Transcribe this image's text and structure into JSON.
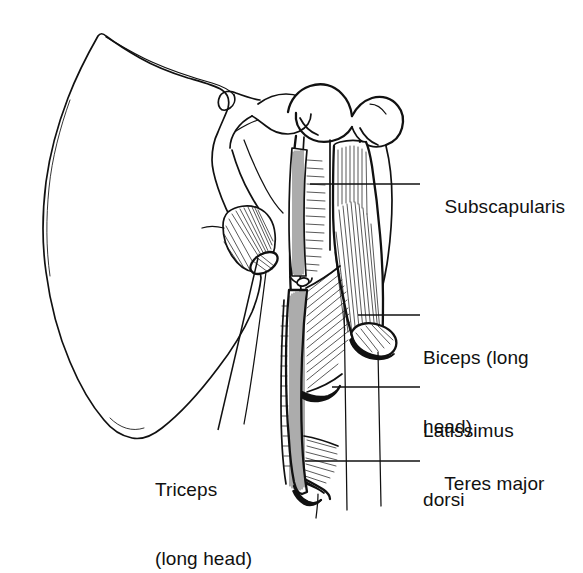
{
  "figure": {
    "background_color": "#ffffff",
    "ink_color": "#111111",
    "width": 583,
    "height": 540
  },
  "labels": [
    {
      "id": "subscapularis",
      "name": "Subscapularis",
      "lines": [
        "Subscapularis"
      ],
      "text_x": 423,
      "text_y": 172,
      "leader": {
        "x1": 310,
        "y1": 184,
        "x2": 420,
        "y2": 184
      }
    },
    {
      "id": "biceps-long-head",
      "name": "Biceps (long head)",
      "lines": [
        "Biceps (long",
        "head)"
      ],
      "text_x": 423,
      "text_y": 300,
      "leader": {
        "x1": 358,
        "y1": 315,
        "x2": 420,
        "y2": 315
      }
    },
    {
      "id": "latissimus-dorsi",
      "name": "Latissimus dorsi",
      "lines": [
        "Latissimus",
        "dorsi"
      ],
      "text_x": 423,
      "text_y": 373,
      "leader": {
        "x1": 332,
        "y1": 387,
        "x2": 420,
        "y2": 387
      }
    },
    {
      "id": "teres-major",
      "name": "Teres major",
      "lines": [
        "Teres major"
      ],
      "text_x": 423,
      "text_y": 449,
      "leader": {
        "x1": 305,
        "y1": 461,
        "x2": 420,
        "y2": 461
      }
    },
    {
      "id": "triceps-long-head",
      "name": "Triceps (long head)",
      "lines": [
        "Triceps",
        "(long head)"
      ],
      "text_x": 155,
      "text_y": 432,
      "leader": {
        "x1": 258,
        "y1": 258,
        "x2": 218,
        "y2": 430
      }
    }
  ],
  "structures": [
    {
      "id": "scapula-body",
      "name": "scapula body (costal surface)"
    },
    {
      "id": "coracoid-process",
      "name": "coracoid process"
    },
    {
      "id": "glenoid-rim",
      "name": "glenoid rim"
    },
    {
      "id": "humeral-head",
      "name": "humeral head"
    },
    {
      "id": "greater-tubercle",
      "name": "greater tubercle"
    },
    {
      "id": "lesser-tubercle",
      "name": "lesser tubercle"
    },
    {
      "id": "bicipital-groove",
      "name": "intertubercular (bicipital) groove"
    },
    {
      "id": "humeral-shaft",
      "name": "humeral shaft"
    },
    {
      "id": "triceps-stump",
      "name": "triceps long head cut stump"
    },
    {
      "id": "biceps-belly",
      "name": "biceps long head cut belly"
    },
    {
      "id": "latissimus-insertion",
      "name": "latissimus dorsi insertion"
    },
    {
      "id": "teres-major-insertion",
      "name": "teres major insertion"
    }
  ]
}
